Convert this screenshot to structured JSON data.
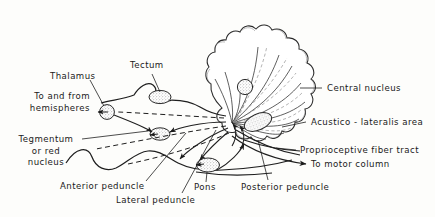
{
  "figure": {
    "kind": "anatomical-diagram",
    "background_color": "#fdfdfb",
    "ink_color": "#1a1a1a",
    "stipple_color": "#7d7d7d"
  },
  "labels": {
    "tectum": "Tectum",
    "thalamus": "Thalamus",
    "to_and_from_hemispheres_line1": "To and from",
    "to_and_from_hemispheres_line2": "hemispheres",
    "tegmentum_line1": "Tegmentum",
    "tegmentum_line2": "or red",
    "tegmentum_line3": "nucleus",
    "anterior_peduncle": "Anterior peduncle",
    "lateral_peduncle": "Lateral peduncle",
    "pons": "Pons",
    "posterior_peduncle": "Posterior peduncle",
    "central_nucleus": "Central nucleus",
    "acustico_lateralis_area": "Acustico - lateralis area",
    "proprioceptive_fiber_tract": "Proprioceptive  fiber tract",
    "to_motor_column": "To motor column"
  },
  "structures": [
    {
      "name": "cerebellum",
      "description": "large scalloped lobed mass, upper right, with radiating fiber tracts"
    },
    {
      "name": "tectum-nucleus",
      "description": "stippled ellipse",
      "cx": 160,
      "cy": 97
    },
    {
      "name": "thalamus-nucleus",
      "description": "stippled circle",
      "cx": 107,
      "cy": 112
    },
    {
      "name": "tegmentum-nucleus",
      "description": "stippled ellipse",
      "cx": 160,
      "cy": 134
    },
    {
      "name": "pons-nucleus",
      "description": "stippled ellipse",
      "cx": 208,
      "cy": 165
    },
    {
      "name": "central-nucleus",
      "description": "stippled circle inside cerebellum",
      "cx": 245,
      "cy": 87
    },
    {
      "name": "acustico-lateralis-area",
      "description": "stippled oblong patch",
      "cx": 258,
      "cy": 122
    },
    {
      "name": "brain-stem-outline",
      "description": "wavy ventral outline running left to right across lower half"
    }
  ]
}
